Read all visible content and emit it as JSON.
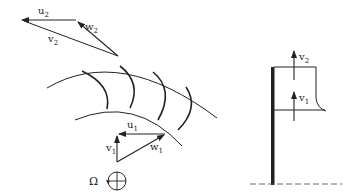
{
  "figure": {
    "type": "impeller velocity triangles diagram",
    "left_panel": {
      "outlet_triangle": {
        "labels": {
          "u": "u",
          "u_sub": "2",
          "w": "w",
          "w_sub": "2",
          "v": "v",
          "v_sub": "2"
        }
      },
      "inlet_triangle": {
        "labels": {
          "u": "u",
          "u_sub": "1",
          "w": "w",
          "w_sub": "1",
          "v": "v",
          "v_sub": "1"
        }
      },
      "rotation": {
        "symbol": "Ω"
      },
      "blade_count_visible": 4
    },
    "right_panel": {
      "labels": {
        "v_top": "v",
        "v_top_sub": "2",
        "v_bottom": "v",
        "v_bottom_sub": "1"
      }
    },
    "colors": {
      "line": "#222222",
      "background": "#ffffff"
    }
  }
}
